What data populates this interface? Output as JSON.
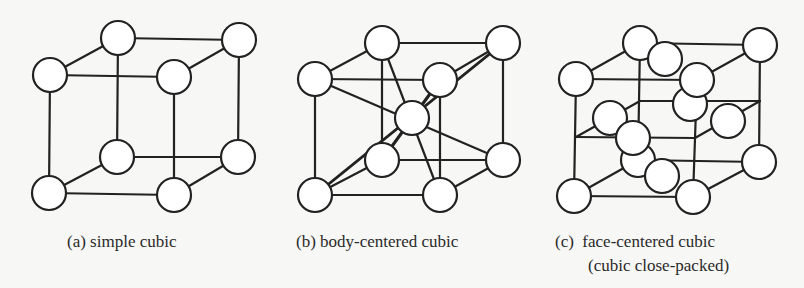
{
  "figures": [
    {
      "id": "a",
      "caption": "(a) simple cubic",
      "atom_radius": 17,
      "atoms": [
        {
          "role": "corner-top-back-left",
          "x": 118,
          "y": 38
        },
        {
          "role": "corner-top-back-right",
          "x": 239,
          "y": 40
        },
        {
          "role": "corner-bottom-back-left",
          "x": 117,
          "y": 157
        },
        {
          "role": "corner-bottom-back-right",
          "x": 238,
          "y": 157
        },
        {
          "role": "corner-top-front-left",
          "x": 50,
          "y": 75
        },
        {
          "role": "corner-top-front-right",
          "x": 174,
          "y": 77
        },
        {
          "role": "corner-bottom-front-left",
          "x": 49,
          "y": 193
        },
        {
          "role": "corner-bottom-front-right",
          "x": 174,
          "y": 195
        }
      ]
    },
    {
      "id": "b",
      "caption": "(b) body-centered cubic",
      "atom_radius": 17,
      "atoms": [
        {
          "role": "corner-top-back-left",
          "x": 382,
          "y": 43
        },
        {
          "role": "corner-top-back-right",
          "x": 503,
          "y": 43
        },
        {
          "role": "corner-bottom-back-left",
          "x": 382,
          "y": 160
        },
        {
          "role": "corner-bottom-back-right",
          "x": 503,
          "y": 160
        },
        {
          "role": "corner-top-front-right",
          "x": 440,
          "y": 80
        },
        {
          "role": "body-center",
          "x": 412,
          "y": 118
        },
        {
          "role": "corner-top-front-left",
          "x": 315,
          "y": 79
        },
        {
          "role": "corner-bottom-front-left",
          "x": 315,
          "y": 195
        },
        {
          "role": "corner-bottom-front-right",
          "x": 440,
          "y": 195
        }
      ]
    },
    {
      "id": "c",
      "caption_line1": "(c)  face-centered cubic",
      "caption_line2": "(cubic close-packed)",
      "atom_radius": 17,
      "atoms": [
        {
          "role": "corner-top-back-left",
          "x": 640,
          "y": 43
        },
        {
          "role": "corner-top-back-right",
          "x": 760,
          "y": 45
        },
        {
          "role": "face-center-top",
          "x": 665,
          "y": 59
        },
        {
          "role": "corner-top-front-left",
          "x": 576,
          "y": 79
        },
        {
          "role": "face-center-back",
          "x": 690,
          "y": 104
        },
        {
          "role": "corner-top-front-right",
          "x": 697,
          "y": 80
        },
        {
          "role": "face-center-right",
          "x": 728,
          "y": 121
        },
        {
          "role": "face-center-left",
          "x": 610,
          "y": 118
        },
        {
          "role": "corner-bottom-back-left",
          "x": 638,
          "y": 160
        },
        {
          "role": "face-center-front",
          "x": 633,
          "y": 138
        },
        {
          "role": "face-center-bottom",
          "x": 662,
          "y": 176
        },
        {
          "role": "corner-bottom-back-right",
          "x": 759,
          "y": 162
        },
        {
          "role": "corner-bottom-front-left",
          "x": 574,
          "y": 196
        },
        {
          "role": "corner-bottom-front-right",
          "x": 693,
          "y": 197
        }
      ]
    }
  ]
}
